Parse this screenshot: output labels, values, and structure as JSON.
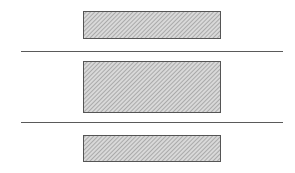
{
  "diagram": {
    "type": "layered-blocks",
    "background": "#ffffff",
    "hatch": {
      "fill": "#d9d9d9",
      "stripe": "#8a8a8a",
      "stroke": "#555555",
      "direction": "diagonal"
    },
    "line_color": "#5a5a5a",
    "blocks": [
      {
        "id": "top-block",
        "x": 83,
        "y": 11,
        "w": 137,
        "h": 27
      },
      {
        "id": "middle-block",
        "x": 83,
        "y": 61,
        "w": 137,
        "h": 51
      },
      {
        "id": "bottom-block",
        "x": 83,
        "y": 135,
        "w": 137,
        "h": 26
      }
    ],
    "separators": [
      {
        "id": "separator-1",
        "x1": 21,
        "x2": 283,
        "y": 51
      },
      {
        "id": "separator-2",
        "x1": 21,
        "x2": 283,
        "y": 122
      }
    ]
  }
}
